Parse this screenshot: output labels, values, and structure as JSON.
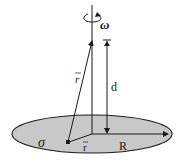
{
  "diagram": {
    "labels": {
      "omega": "ω",
      "r_prime": "r⃗′",
      "r_prime_text": "r",
      "d": "d",
      "sigma": "σ",
      "r": "r",
      "R": "R"
    },
    "colors": {
      "disk_fill": "#c8c8c8",
      "stroke": "#1a1a1a",
      "background": "#ffffff"
    },
    "geometry": {
      "disk_center": [
        92,
        134
      ],
      "disk_radii": [
        80,
        19
      ],
      "axis_top": 5,
      "field_point": [
        92,
        40
      ],
      "source_point": [
        68,
        142
      ],
      "d_line_x": 107
    }
  }
}
